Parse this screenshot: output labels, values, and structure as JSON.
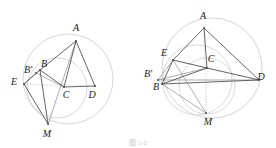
{
  "figure": {
    "caption": "图 1-2",
    "background_color": "#ffffff",
    "stroke_color": "#4a4a4a",
    "light_stroke_color": "#cfcfcf",
    "label_color": "#1a1a1a",
    "panels": [
      {
        "id": "left-panel",
        "name": "left-diagram",
        "main_circle": {
          "cx": 68,
          "cy": 79,
          "r": 45
        },
        "secondary_circles": [
          {
            "name": "circle-bcme",
            "cx": 57,
            "cy": 88,
            "r": 30
          }
        ],
        "points": [
          {
            "id": "A",
            "label": "A",
            "x": 76,
            "y": 41,
            "lx": 76,
            "ly": 31
          },
          {
            "id": "B",
            "label": "B",
            "x": 40,
            "y": 70,
            "lx": 44,
            "ly": 67
          },
          {
            "id": "Bp",
            "label": "B'",
            "x": 36,
            "y": 73,
            "lx": 28,
            "ly": 73
          },
          {
            "id": "E",
            "label": "E",
            "x": 24,
            "y": 84,
            "lx": 14,
            "ly": 85
          },
          {
            "id": "C",
            "label": "C",
            "x": 64,
            "y": 87,
            "lx": 66,
            "ly": 98
          },
          {
            "id": "D",
            "label": "D",
            "x": 95,
            "y": 86,
            "lx": 92,
            "ly": 98
          },
          {
            "id": "M",
            "label": "M",
            "x": 48,
            "y": 124,
            "lx": 47,
            "ly": 137
          }
        ],
        "solid_segments": [
          [
            "A",
            "B"
          ],
          [
            "A",
            "C"
          ],
          [
            "A",
            "D"
          ],
          [
            "C",
            "D"
          ],
          [
            "B",
            "C"
          ],
          [
            "B",
            "E"
          ],
          [
            "E",
            "M"
          ],
          [
            "B",
            "M"
          ]
        ],
        "thin_segments": [
          [
            "A",
            "M"
          ],
          [
            "Bp",
            "E"
          ],
          [
            "Bp",
            "C"
          ]
        ],
        "dotted_segments": [
          [
            "E",
            "C"
          ],
          [
            "E",
            "D"
          ],
          [
            "C",
            "M"
          ]
        ]
      },
      {
        "id": "right-panel",
        "name": "right-diagram",
        "main_circle": {
          "cx": 212,
          "cy": 68,
          "r": 50
        },
        "secondary_circles": [
          {
            "name": "circle-ecm",
            "cx": 197,
            "cy": 80,
            "r": 35
          },
          {
            "name": "circle-bcm",
            "cx": 207,
            "cy": 86,
            "r": 28
          }
        ],
        "points": [
          {
            "id": "A",
            "label": "A",
            "x": 204,
            "y": 28,
            "lx": 203,
            "ly": 19
          },
          {
            "id": "E",
            "label": "E",
            "x": 173,
            "y": 60,
            "lx": 164,
            "ly": 56
          },
          {
            "id": "Bp",
            "label": "B'",
            "x": 158,
            "y": 80,
            "lx": 148,
            "ly": 77
          },
          {
            "id": "B",
            "label": "B",
            "x": 162,
            "y": 84,
            "lx": 156,
            "ly": 90
          },
          {
            "id": "C",
            "label": "C",
            "x": 207,
            "y": 68,
            "lx": 211,
            "ly": 62
          },
          {
            "id": "D",
            "label": "D",
            "x": 259,
            "y": 80,
            "lx": 261,
            "ly": 80
          },
          {
            "id": "M",
            "label": "M",
            "x": 206,
            "y": 113,
            "lx": 208,
            "ly": 125
          }
        ],
        "solid_segments": [
          [
            "A",
            "E"
          ],
          [
            "A",
            "C"
          ],
          [
            "A",
            "D"
          ],
          [
            "E",
            "C"
          ],
          [
            "C",
            "D"
          ],
          [
            "E",
            "B"
          ],
          [
            "B",
            "C"
          ],
          [
            "B",
            "D"
          ]
        ],
        "thin_segments": [
          [
            "Bp",
            "E"
          ],
          [
            "Bp",
            "C"
          ],
          [
            "Bp",
            "D"
          ],
          [
            "E",
            "M"
          ],
          [
            "B",
            "M"
          ]
        ],
        "dotted_segments": [
          [
            "A",
            "M"
          ],
          [
            "C",
            "M"
          ],
          [
            "E",
            "D"
          ]
        ]
      }
    ]
  }
}
